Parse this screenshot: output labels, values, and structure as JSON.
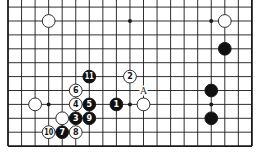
{
  "diagram": {
    "type": "go-board-fragment",
    "columns": 19,
    "visible_rows": 10,
    "edges": {
      "left": true,
      "right": true,
      "bottom": true,
      "top": false
    },
    "geometry": {
      "x0": 8,
      "dx": 13.55,
      "y0": 21,
      "dy": 13.9
    },
    "colors": {
      "line": "#1a1a1a",
      "black": "#111111",
      "white": "#ffffff",
      "background": "#ffffff"
    },
    "star_points": [
      {
        "col": 9,
        "row": 0
      },
      {
        "col": 15,
        "row": 0
      },
      {
        "col": 3,
        "row": 6
      },
      {
        "col": 9,
        "row": 6
      },
      {
        "col": 15,
        "row": 6
      }
    ],
    "stones": [
      {
        "color": "white",
        "col": 3,
        "row": 0,
        "label": ""
      },
      {
        "color": "white",
        "col": 16,
        "row": 0,
        "label": ""
      },
      {
        "color": "black",
        "col": 16,
        "row": 2,
        "label": ""
      },
      {
        "color": "black",
        "col": 6,
        "row": 4,
        "label": "11"
      },
      {
        "color": "white",
        "col": 9,
        "row": 4,
        "label": "2"
      },
      {
        "color": "white",
        "col": 5,
        "row": 5,
        "label": "6"
      },
      {
        "color": "black",
        "col": 15,
        "row": 5,
        "label": ""
      },
      {
        "color": "white",
        "col": 2,
        "row": 6,
        "label": ""
      },
      {
        "color": "white",
        "col": 5,
        "row": 6,
        "label": "4"
      },
      {
        "color": "black",
        "col": 6,
        "row": 6,
        "label": "5"
      },
      {
        "color": "black",
        "col": 8,
        "row": 6,
        "label": "1"
      },
      {
        "color": "white",
        "col": 10,
        "row": 6,
        "label": ""
      },
      {
        "color": "white",
        "col": 4,
        "row": 7,
        "label": ""
      },
      {
        "color": "black",
        "col": 5,
        "row": 7,
        "label": "3"
      },
      {
        "color": "black",
        "col": 6,
        "row": 7,
        "label": "9"
      },
      {
        "color": "black",
        "col": 15,
        "row": 7,
        "label": ""
      },
      {
        "color": "white",
        "col": 3,
        "row": 8,
        "label": "10"
      },
      {
        "color": "black",
        "col": 4,
        "row": 8,
        "label": "7"
      },
      {
        "color": "white",
        "col": 5,
        "row": 8,
        "label": "8"
      }
    ],
    "point_labels": [
      {
        "col": 10,
        "row": 5,
        "text": "A"
      }
    ]
  }
}
